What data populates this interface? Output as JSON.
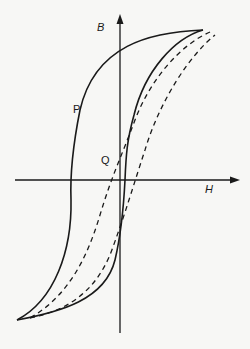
{
  "figure": {
    "type": "hysteresis-diagram",
    "axes": {
      "vertical_label": "B",
      "horizontal_label": "H"
    },
    "points": [
      {
        "label": "P"
      },
      {
        "label": "Q"
      }
    ],
    "curves": [
      {
        "name": "major-hysteresis-loop",
        "style": "solid"
      },
      {
        "name": "minor-loop",
        "style": "dashed"
      }
    ],
    "colors": {
      "background": "#f7f7f5",
      "ink": "#1a1a1a"
    }
  }
}
